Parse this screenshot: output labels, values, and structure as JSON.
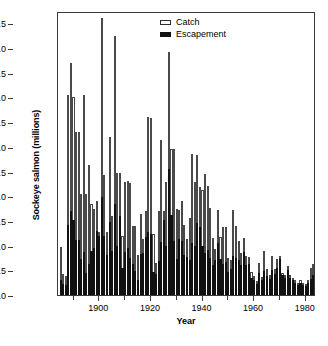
{
  "chart_data": {
    "type": "bar",
    "stacked": true,
    "title": "",
    "subtitle": "",
    "xlabel": "Year",
    "ylabel": "Sockeye salmon (millions)",
    "xlim": [
      1884,
      1984
    ],
    "ylim": [
      0,
      5.75
    ],
    "grid": false,
    "legend_position": "top-right",
    "x_ticks_major": [
      1900,
      1920,
      1940,
      1960,
      1980
    ],
    "x_ticks_minor": [
      1890,
      1910,
      1930,
      1950,
      1970
    ],
    "y_ticks": [
      0.0,
      0.5,
      1.0,
      1.5,
      2.0,
      2.5,
      3.0,
      3.5,
      4.0,
      4.5,
      5.0,
      5.5
    ],
    "y_tick_labels": [
      "0.0",
      "0.5",
      "1.0",
      "1.5",
      "2.0",
      "2.5",
      "3.0",
      "3.5",
      "4.0",
      "4.5",
      "5.0",
      "5.5"
    ],
    "x_tick_labels": [
      "1900",
      "1920",
      "1940",
      "1960",
      "1980"
    ],
    "series": [
      {
        "name": "Escapement",
        "color": "#111111",
        "values": [
          0.3,
          0.22,
          0.2,
          1.42,
          1.7,
          1.52,
          1.12,
          1.12,
          0.72,
          0.88,
          0.45,
          0.62,
          0.9,
          0.95,
          1.3,
          1.2,
          1.98,
          1.2,
          0.82,
          1.47,
          0.9,
          1.85,
          1.0,
          1.6,
          0.55,
          0.88,
          0.96,
          0.75,
          0.62,
          0.48,
          0.3,
          0.84,
          0.85,
          1.18,
          1.28,
          1.23,
          0.46,
          0.42,
          0.68,
          1.08,
          1.52,
          1.0,
          2.55,
          1.63,
          1.1,
          0.72,
          1.13,
          1.1,
          0.82,
          0.76,
          0.7,
          1.05,
          1.0,
          1.46,
          1.38,
          1.0,
          0.85,
          0.92,
          0.74,
          0.6,
          0.7,
          1.05,
          0.72,
          0.62,
          0.67,
          0.46,
          0.52,
          0.8,
          0.74,
          0.7,
          0.6,
          0.88,
          0.6,
          0.62,
          0.35,
          0.3,
          0.22,
          0.45,
          0.3,
          0.48,
          0.38,
          0.33,
          0.5,
          0.43,
          0.55,
          0.72,
          0.4,
          0.35,
          0.5,
          0.35,
          0.3,
          0.25,
          0.2,
          0.25,
          0.2,
          0.18,
          0.24,
          0.32,
          0.4,
          0.55,
          0.48,
          0.28,
          0.22,
          0.33,
          0.22,
          0.4
        ]
      },
      {
        "name": "Catch",
        "color": "#ffffff",
        "values": [
          0.68,
          0.2,
          0.18,
          2.62,
          3.0,
          2.48,
          2.18,
          2.18,
          1.33,
          3.17,
          1.6,
          2.02,
          0.95,
          0.8,
          0.6,
          0.08,
          3.62,
          1.22,
          0.45,
          1.73,
          0.7,
          3.4,
          1.48,
          0.88,
          0.65,
          1.4,
          1.34,
          1.52,
          0.78,
          0.92,
          0.52,
          0.8,
          0.28,
          0.52,
          2.32,
          2.36,
          0.78,
          0.23,
          1.02,
          2.06,
          0.18,
          1.28,
          2.38,
          1.32,
          1.86,
          1.02,
          0.6,
          0.8,
          0.6,
          0.38,
          0.86,
          1.8,
          1.28,
          1.38,
          0.8,
          1.12,
          1.6,
          1.28,
          1.02,
          0.55,
          0.24,
          0.68,
          0.46,
          0.76,
          0.7,
          0.28,
          0.18,
          0.92,
          0.66,
          0.4,
          0.26,
          0.28,
          0.18,
          0.14,
          0.12,
          0.08,
          0.06,
          0.2,
          0.06,
          0.42,
          0.14,
          0.07,
          0.28,
          0.1,
          0.18,
          0.06,
          0.05,
          0.06,
          0.08,
          0.05,
          0.04,
          0.05,
          0.04,
          0.06,
          0.04,
          0.04,
          0.06,
          0.22,
          0.22,
          0.12,
          0.12,
          0.05,
          0.04,
          0.07,
          0.04,
          0.14
        ]
      }
    ],
    "x": [
      1885,
      1886,
      1887,
      1888,
      1889,
      1890,
      1891,
      1892,
      1893,
      1894,
      1895,
      1896,
      1897,
      1898,
      1899,
      1900,
      1901,
      1902,
      1903,
      1904,
      1905,
      1906,
      1907,
      1908,
      1909,
      1910,
      1911,
      1912,
      1913,
      1914,
      1915,
      1916,
      1917,
      1918,
      1919,
      1920,
      1921,
      1922,
      1923,
      1924,
      1925,
      1926,
      1927,
      1928,
      1929,
      1930,
      1931,
      1932,
      1933,
      1934,
      1935,
      1936,
      1937,
      1938,
      1939,
      1940,
      1941,
      1942,
      1943,
      1944,
      1945,
      1946,
      1947,
      1948,
      1949,
      1950,
      1951,
      1952,
      1953,
      1954,
      1955,
      1956,
      1957,
      1958,
      1959,
      1960,
      1961,
      1962,
      1963,
      1964,
      1965,
      1966,
      1967,
      1968,
      1969,
      1970,
      1971,
      1972,
      1973,
      1974,
      1975,
      1976,
      1977,
      1978,
      1979,
      1980,
      1981,
      1982,
      1983,
      1984,
      1985,
      1986,
      1987,
      1988,
      1989,
      1990
    ]
  },
  "legend": {
    "items": [
      {
        "label": "Catch"
      },
      {
        "label": "Escapement"
      }
    ]
  },
  "axes": {
    "y_title": "Sockeye salmon (millions)",
    "x_title": "Year"
  }
}
